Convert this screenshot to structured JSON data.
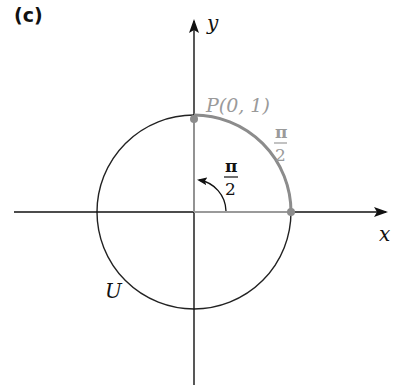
{
  "panel_label": "(c)",
  "axes": {
    "x_label": "x",
    "y_label": "y"
  },
  "circle": {
    "label": "U",
    "center_px": [
      194,
      212
    ],
    "radius_px": 97
  },
  "point": {
    "label": "P(0, 1)",
    "coords": [
      0,
      1
    ]
  },
  "arc_length_label": {
    "numerator": "π",
    "denominator": "2"
  },
  "angle_label": {
    "numerator": "π",
    "denominator": "2"
  },
  "colors": {
    "axis": "#111111",
    "circle": "#222222",
    "highlight": "#8c8c8c",
    "highlight_text": "#9a9a9a"
  }
}
